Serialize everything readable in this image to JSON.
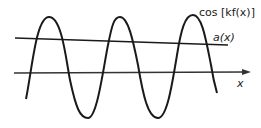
{
  "diagram": {
    "labels": {
      "wave": "cos [kf(x)]",
      "envelope": "a(x)",
      "axis": "x"
    },
    "colors": {
      "stroke": "#1a1a1a",
      "axis": "#333333",
      "background": "#ffffff"
    },
    "curves": [
      {
        "name": "cos-kf-x",
        "description": "oscillating wave with 3 peaks and 2 troughs"
      },
      {
        "name": "a-x",
        "description": "slowly decreasing nearly horizontal line"
      },
      {
        "name": "x-axis",
        "description": "horizontal axis with arrow pointing right"
      }
    ]
  }
}
